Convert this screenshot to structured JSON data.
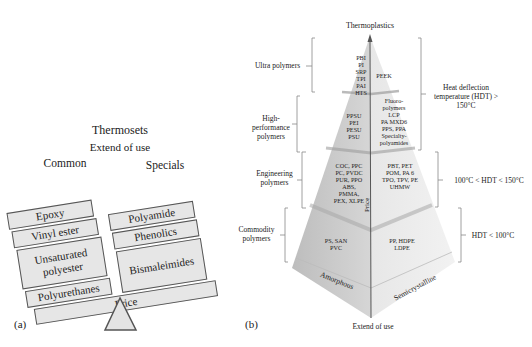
{
  "panel_a": {
    "tag": "(a)",
    "title": "Thermosets",
    "axis_label": "Extend of use",
    "left_heading": "Common",
    "right_heading": "Specials",
    "common": [
      "Epoxy",
      "Vinyl ester",
      "Unsaturated polyester",
      "Polyurethanes"
    ],
    "specials": [
      "Polyamide",
      "Phenolics",
      "Bismaleimides"
    ],
    "beam_label": "Price"
  },
  "panel_b": {
    "tag": "(b)",
    "title": "Thermoplastics",
    "bottom_label": "Extend of use",
    "vertical_axis_label": "Price",
    "base_left": "Amorphous",
    "base_right": "Semicrystalline",
    "tiers": [
      {
        "name": "Ultra polymers",
        "amorphous": [
          "PBI",
          "PI",
          "SRP",
          "TPI",
          "PAI",
          "HTS"
        ],
        "semicrystalline": [
          "PEEK"
        ]
      },
      {
        "name": "High-performance polymers",
        "amorphous": [
          "PPSU",
          "PEI",
          "PESU",
          "PSU"
        ],
        "semicrystalline": [
          "Fluoro-",
          "polymers",
          "LCP",
          "PA MXD6",
          "PPS, PPA",
          "Specialty-",
          "polyamides"
        ]
      },
      {
        "name": "Engineering polymers",
        "amorphous": [
          "COC, PPC",
          "PC, PVDC",
          "PUR, PPO",
          "ABS,",
          "PMMA,",
          "PEX, XLPE"
        ],
        "semicrystalline": [
          "PBT, PET",
          "POM, PA 6",
          "TPO, TPV, PE",
          "UHMW"
        ]
      },
      {
        "name": "Commodity polymers",
        "amorphous": [
          "PS, SAN",
          "PVC"
        ],
        "semicrystalline": [
          "PP, HDPE",
          "LDPE"
        ]
      }
    ],
    "hdt_ranges": [
      "Heat deflection temperature (HDT) > 150°C",
      "100°C < HDT < 150°C",
      "HDT < 100°C"
    ]
  }
}
